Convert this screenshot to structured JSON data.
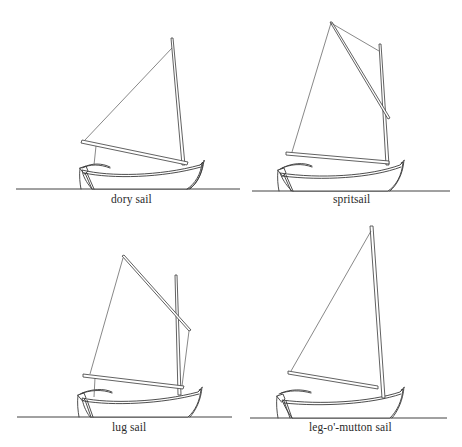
{
  "figure": {
    "panels": [
      {
        "id": "dory",
        "caption": "dory sail"
      },
      {
        "id": "sprit",
        "caption": "spritsail"
      },
      {
        "id": "lug",
        "caption": "lug sail"
      },
      {
        "id": "leg",
        "caption": "leg-o'-mutton sail"
      }
    ],
    "colors": {
      "background": "#ffffff",
      "line": "#3a3a3a",
      "text": "#2a2a2a"
    }
  }
}
